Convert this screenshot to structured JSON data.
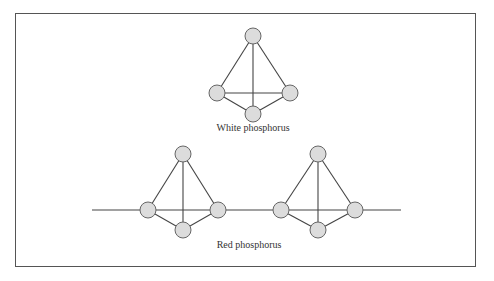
{
  "figure": {
    "colors": {
      "node_fill": "#dcdcdc",
      "node_stroke": "#666666",
      "bond": "#444444",
      "frame": "#555555"
    },
    "node_radius": 8,
    "white_phosphorus": {
      "label": "White phosphorus",
      "label_pos": [
        253,
        129
      ],
      "nodes": [
        {
          "id": "top",
          "x": 253,
          "y": 36
        },
        {
          "id": "left",
          "x": 217,
          "y": 93
        },
        {
          "id": "right",
          "x": 290,
          "y": 93
        },
        {
          "id": "bottom",
          "x": 253,
          "y": 114
        }
      ],
      "bonds": [
        [
          "top",
          "left"
        ],
        [
          "top",
          "right"
        ],
        [
          "top",
          "bottom"
        ],
        [
          "left",
          "right"
        ],
        [
          "left",
          "bottom"
        ],
        [
          "right",
          "bottom"
        ]
      ]
    },
    "red_phosphorus": {
      "label": "Red phosphorus",
      "label_pos": [
        249,
        246
      ],
      "chain_line": {
        "x1": 92,
        "x2": 401,
        "y": 210
      },
      "units": [
        {
          "nodes": [
            {
              "id": "top",
              "x": 183,
              "y": 154
            },
            {
              "id": "left",
              "x": 148,
              "y": 210
            },
            {
              "id": "right",
              "x": 218,
              "y": 210
            },
            {
              "id": "bottom",
              "x": 183,
              "y": 230
            }
          ]
        },
        {
          "nodes": [
            {
              "id": "top",
              "x": 318,
              "y": 154
            },
            {
              "id": "left",
              "x": 281,
              "y": 210
            },
            {
              "id": "right",
              "x": 355,
              "y": 210
            },
            {
              "id": "bottom",
              "x": 318,
              "y": 230
            }
          ]
        }
      ],
      "unit_bonds": [
        [
          "top",
          "left"
        ],
        [
          "top",
          "right"
        ],
        [
          "top",
          "bottom"
        ],
        [
          "left",
          "bottom"
        ],
        [
          "right",
          "bottom"
        ]
      ]
    }
  }
}
